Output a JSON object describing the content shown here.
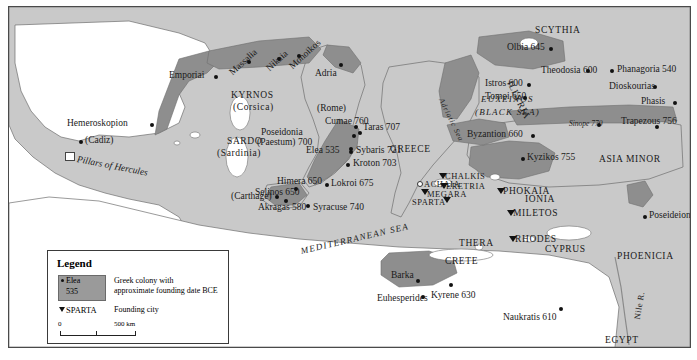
{
  "map": {
    "title": "Greek Colonization of the Mediterranean and Black Sea",
    "colors": {
      "land": "#c9c9c9",
      "colony": "#8e8e8e",
      "water": "#ffffff",
      "border": "#4a4a4a",
      "text": "#1a1a1a"
    }
  },
  "legend": {
    "title": "Legend",
    "swatch_city": "Elea",
    "swatch_date": "535",
    "colony_desc_line1": "Greek colony with",
    "colony_desc_line2": "approximate founding date BCE",
    "founding_city_label": "SPARTA",
    "founding_city_desc": "Founding city",
    "scale_start": "0",
    "scale_end": "500 km"
  },
  "seas": [
    {
      "name": "MEDITERRANEAN  SEA"
    },
    {
      "name": "EUXEINOS"
    },
    {
      "name": "(BLACK SEA)"
    },
    {
      "name": "Adriatic Sea"
    }
  ],
  "regions": [
    {
      "name": "SCYTHIA"
    },
    {
      "name": "ASIA MINOR"
    },
    {
      "name": "PHOENICIA"
    },
    {
      "name": "GREECE"
    },
    {
      "name": "ILLYRIA"
    },
    {
      "name": "IONIA"
    },
    {
      "name": "CYPRUS"
    },
    {
      "name": "CRETE"
    },
    {
      "name": "RHODES"
    },
    {
      "name": "THERA"
    },
    {
      "name": "ACHAIA"
    },
    {
      "name": "EGYPT"
    },
    {
      "name": "KYRNOS"
    },
    {
      "name": "(Corsica)"
    },
    {
      "name": "SARDO"
    },
    {
      "name": "(Sardinia)"
    },
    {
      "name": "Nile R."
    },
    {
      "name": "Pillars of Hercules"
    }
  ],
  "colonies": [
    {
      "name": "Emporiai",
      "date": ""
    },
    {
      "name": "Hemeroskopion",
      "date": ""
    },
    {
      "name": "Massalia",
      "date": ""
    },
    {
      "name": "Nikaia",
      "date": ""
    },
    {
      "name": "Monoikos",
      "date": ""
    },
    {
      "name": "Adria",
      "date": ""
    },
    {
      "name": "Cumae",
      "date": "760"
    },
    {
      "name": "Poseidonia",
      "date": "700"
    },
    {
      "name": "(Paestum)",
      "date": ""
    },
    {
      "name": "Elea",
      "date": "535"
    },
    {
      "name": "Taras",
      "date": "707"
    },
    {
      "name": "Sybaris",
      "date": "721"
    },
    {
      "name": "Kroton",
      "date": "703"
    },
    {
      "name": "Lokroi",
      "date": "675"
    },
    {
      "name": "Himera",
      "date": "650"
    },
    {
      "name": "Selinos",
      "date": "650"
    },
    {
      "name": "Akragas",
      "date": "580"
    },
    {
      "name": "Syracuse",
      "date": "740"
    },
    {
      "name": "Byzantion",
      "date": "660"
    },
    {
      "name": "Kyzikos",
      "date": "755"
    },
    {
      "name": "Istros",
      "date": "600"
    },
    {
      "name": "Tomoi",
      "date": "650"
    },
    {
      "name": "Olbia",
      "date": "645"
    },
    {
      "name": "Theodosia",
      "date": "600"
    },
    {
      "name": "Phanagoria",
      "date": "540"
    },
    {
      "name": "Dioskourias",
      "date": ""
    },
    {
      "name": "Phasis",
      "date": ""
    },
    {
      "name": "Trapezous",
      "date": "756"
    },
    {
      "name": "Sinope",
      "date": "770"
    },
    {
      "name": "Poseideion",
      "date": ""
    },
    {
      "name": "Naukratis",
      "date": "610"
    },
    {
      "name": "Kyrene",
      "date": "630"
    },
    {
      "name": "Barka",
      "date": ""
    },
    {
      "name": "Euhesperides",
      "date": ""
    }
  ],
  "founding_cities": [
    {
      "name": "CHALKIS"
    },
    {
      "name": "ERETRIA"
    },
    {
      "name": "MEGARA"
    },
    {
      "name": "SPARTA"
    },
    {
      "name": "PHOKAIA"
    },
    {
      "name": "MILETOS"
    }
  ],
  "non_greek": [
    {
      "name": "(Cadiz)"
    },
    {
      "name": "(Carthage)"
    },
    {
      "name": "(Rome)"
    }
  ],
  "labels": {
    "emporiai": "Emporiai",
    "hemeroskopion": "Hemeroskopion",
    "cadiz": "(Cadiz)",
    "pillars": "Pillars of Hercules",
    "carthage": "(Carthage)",
    "rome": "(Rome)",
    "massalia": "Massalia",
    "nikaia": "Nikaia",
    "monoikos": "Monoikos",
    "adria": "Adria",
    "kyrnos": "KYRNOS",
    "corsica": "(Corsica)",
    "sardo": "SARDO",
    "sardinia": "(Sardinia)",
    "illyria": "ILLYRIA",
    "adriatic": "Adriatic Sea",
    "cumae": "Cumae 760",
    "poseidonia": "Poseidonia",
    "paestum": "(Paestum) 700",
    "elea": "Elea 535",
    "taras": "Taras 707",
    "sybaris": "Sybaris 721",
    "kroton": "Kroton 703",
    "lokroi": "Lokroi 675",
    "himera": "Himera 650",
    "selinos": "Selinos 650",
    "akragas": "Akragas 580",
    "syracuse": "Syracuse 740",
    "mediterranean": "MEDITERRANEAN  SEA",
    "greece": "GREECE",
    "chalkis": "CHALKIS",
    "eretria": "ERETRIA",
    "megara": "MEGARA",
    "achaia": "ACHAIA",
    "sparta": "SPARTA",
    "thera": "THERA",
    "crete": "CRETE",
    "rhodes": "RHODES",
    "phokaia": "PHOKAIA",
    "miletos": "MILETOS",
    "ionia": "IONIA",
    "byzantion": "Byzantion 660",
    "kyzikos": "Kyzikos 755",
    "scythia": "SCYTHIA",
    "olbia": "Olbia 645",
    "theodosia": "Theodosia 600",
    "phanagoria": "Phanagoria 540",
    "istros": "Istros 600",
    "tomoi": "Tomoi 650",
    "euxeinos": "EUXEINOS",
    "blacksea": "(BLACK SEA)",
    "dioskourias": "Dioskourias",
    "phasis": "Phasis",
    "trapezous": "Trapezous 756",
    "sinope": "Sinope 770",
    "asiaminor": "ASIA MINOR",
    "poseideion": "Poseideion",
    "cyprus": "CYPRUS",
    "phoenicia": "PHOENICIA",
    "barka": "Barka",
    "euhesperides": "Euhesperides",
    "kyrene": "Kyrene 630",
    "naukratis": "Naukratis 610",
    "egypt": "EGYPT",
    "nile": "Nile R."
  }
}
